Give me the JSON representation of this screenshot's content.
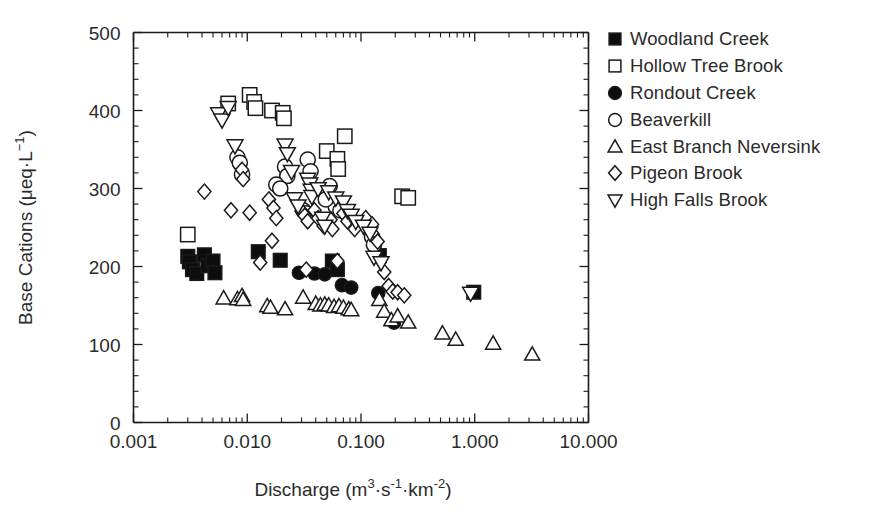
{
  "chart_data": {
    "type": "scatter",
    "title": "",
    "xlabel": "Discharge (m3·s-1·km-2)",
    "xlabel_parts": {
      "name": "Discharge",
      "open": " (m",
      "sup1": "3",
      "mid1": "·s",
      "sup2": "-1",
      "mid2": "·km",
      "sup3": "-2",
      "close": ")"
    },
    "ylabel": "Base Cations (μeq·L-1)",
    "ylabel_parts": {
      "name": "Base Cations",
      "open": " (μeq·L",
      "sup1": "−1",
      "close": ")"
    },
    "xscale": "log",
    "yscale": "linear",
    "xlim": [
      0.001,
      10.0
    ],
    "ylim": [
      0,
      500
    ],
    "xticks": [
      0.001,
      0.01,
      0.1,
      1.0,
      10.0
    ],
    "xtick_labels": [
      "0.001",
      "0.010",
      "0.100",
      "1.000",
      "10.000"
    ],
    "yticks": [
      0,
      100,
      200,
      300,
      400,
      500
    ],
    "ytick_labels": [
      "0",
      "100",
      "200",
      "300",
      "400",
      "500"
    ],
    "y_minor_step": 20,
    "grid": false,
    "legend_position": "right",
    "series": [
      {
        "name": "Woodland Creek",
        "marker": "square-filled",
        "points": [
          [
            0.003,
            213
          ],
          [
            0.0031,
            206
          ],
          [
            0.0033,
            196
          ],
          [
            0.0036,
            191
          ],
          [
            0.0042,
            215
          ],
          [
            0.0045,
            201
          ],
          [
            0.005,
            207
          ],
          [
            0.0052,
            192
          ],
          [
            0.0125,
            219
          ],
          [
            0.0195,
            208
          ],
          [
            0.056,
            207
          ],
          [
            0.062,
            196
          ],
          [
            0.145,
            214
          ],
          [
            0.98,
            167
          ]
        ]
      },
      {
        "name": "Hollow Tree Brook",
        "marker": "square-open",
        "points": [
          [
            0.003,
            241
          ],
          [
            0.0068,
            409
          ],
          [
            0.0105,
            420
          ],
          [
            0.0115,
            411
          ],
          [
            0.0118,
            403
          ],
          [
            0.0165,
            400
          ],
          [
            0.0205,
            397
          ],
          [
            0.021,
            390
          ],
          [
            0.05,
            348
          ],
          [
            0.072,
            367
          ],
          [
            0.062,
            338
          ],
          [
            0.063,
            325
          ],
          [
            0.23,
            290
          ],
          [
            0.26,
            288
          ]
        ]
      },
      {
        "name": "Rondout Creek",
        "marker": "circle-filled",
        "points": [
          [
            0.0285,
            192
          ],
          [
            0.039,
            191
          ],
          [
            0.048,
            190
          ],
          [
            0.068,
            176
          ],
          [
            0.082,
            173
          ],
          [
            0.142,
            166
          ],
          [
            0.195,
            128
          ]
        ]
      },
      {
        "name": "Beaverkill",
        "marker": "circle-open",
        "points": [
          [
            0.0082,
            340
          ],
          [
            0.0086,
            333
          ],
          [
            0.009,
            318
          ],
          [
            0.0215,
            328
          ],
          [
            0.0225,
            316
          ],
          [
            0.018,
            305
          ],
          [
            0.0195,
            300
          ],
          [
            0.034,
            337
          ],
          [
            0.036,
            322
          ],
          [
            0.053,
            303
          ],
          [
            0.031,
            272
          ],
          [
            0.033,
            268
          ],
          [
            0.06,
            277
          ],
          [
            0.066,
            272
          ],
          [
            0.049,
            286
          ],
          [
            0.125,
            238
          ],
          [
            0.13,
            228
          ]
        ]
      },
      {
        "name": "East Branch Neversink",
        "marker": "triangle-up-open",
        "points": [
          [
            0.0062,
            159
          ],
          [
            0.0082,
            158
          ],
          [
            0.009,
            162
          ],
          [
            0.0092,
            157
          ],
          [
            0.015,
            149
          ],
          [
            0.016,
            147
          ],
          [
            0.0215,
            145
          ],
          [
            0.031,
            160
          ],
          [
            0.04,
            152
          ],
          [
            0.044,
            150
          ],
          [
            0.048,
            151
          ],
          [
            0.052,
            150
          ],
          [
            0.058,
            148
          ],
          [
            0.064,
            149
          ],
          [
            0.07,
            147
          ],
          [
            0.078,
            145
          ],
          [
            0.082,
            144
          ],
          [
            0.145,
            157
          ],
          [
            0.16,
            142
          ],
          [
            0.185,
            131
          ],
          [
            0.21,
            136
          ],
          [
            0.26,
            128
          ],
          [
            0.52,
            114
          ],
          [
            0.68,
            106
          ],
          [
            1.45,
            101
          ],
          [
            3.2,
            87
          ]
        ]
      },
      {
        "name": "Pigeon Brook",
        "marker": "diamond-open",
        "points": [
          [
            0.0042,
            296
          ],
          [
            0.0072,
            272
          ],
          [
            0.009,
            324
          ],
          [
            0.0092,
            312
          ],
          [
            0.0105,
            269
          ],
          [
            0.0155,
            286
          ],
          [
            0.017,
            275
          ],
          [
            0.018,
            262
          ],
          [
            0.03,
            271
          ],
          [
            0.032,
            265
          ],
          [
            0.034,
            258
          ],
          [
            0.0165,
            233
          ],
          [
            0.039,
            272
          ],
          [
            0.042,
            262
          ],
          [
            0.047,
            252
          ],
          [
            0.054,
            260
          ],
          [
            0.056,
            248
          ],
          [
            0.07,
            268
          ],
          [
            0.076,
            258
          ],
          [
            0.088,
            248
          ],
          [
            0.013,
            205
          ],
          [
            0.033,
            196
          ],
          [
            0.062,
            207
          ],
          [
            0.11,
            262
          ],
          [
            0.125,
            254
          ],
          [
            0.14,
            232
          ],
          [
            0.16,
            193
          ],
          [
            0.175,
            175
          ],
          [
            0.19,
            168
          ],
          [
            0.21,
            167
          ],
          [
            0.24,
            163
          ]
        ]
      },
      {
        "name": "High Falls Brook",
        "marker": "triangle-down-open",
        "points": [
          [
            0.0056,
            396
          ],
          [
            0.006,
            388
          ],
          [
            0.0068,
            404
          ],
          [
            0.0078,
            355
          ],
          [
            0.0215,
            356
          ],
          [
            0.0225,
            345
          ],
          [
            0.0245,
            322
          ],
          [
            0.034,
            312
          ],
          [
            0.0355,
            306
          ],
          [
            0.0365,
            298
          ],
          [
            0.037,
            290
          ],
          [
            0.026,
            287
          ],
          [
            0.028,
            278
          ],
          [
            0.042,
            300
          ],
          [
            0.052,
            296
          ],
          [
            0.06,
            288
          ],
          [
            0.07,
            283
          ],
          [
            0.076,
            272
          ],
          [
            0.082,
            266
          ],
          [
            0.09,
            258
          ],
          [
            0.105,
            252
          ],
          [
            0.046,
            262
          ],
          [
            0.048,
            252
          ],
          [
            0.12,
            243
          ],
          [
            0.13,
            212
          ],
          [
            0.15,
            205
          ],
          [
            0.92,
            166
          ]
        ]
      }
    ]
  },
  "legend": {
    "items": [
      {
        "label": "Woodland Creek",
        "marker": "square-filled"
      },
      {
        "label": "Hollow Tree Brook",
        "marker": "square-open"
      },
      {
        "label": "Rondout Creek",
        "marker": "circle-filled"
      },
      {
        "label": "Beaverkill",
        "marker": "circle-open"
      },
      {
        "label": "East Branch Neversink",
        "marker": "triangle-up-open"
      },
      {
        "label": "Pigeon Brook",
        "marker": "diamond-open"
      },
      {
        "label": "High Falls Brook",
        "marker": "triangle-down-open"
      }
    ]
  },
  "colors": {
    "ink": "#1a1a1a",
    "text": "#2b2b2b",
    "background": "#ffffff",
    "marker_fill": "#0d0d0d",
    "marker_open_fill": "#ffffff"
  }
}
